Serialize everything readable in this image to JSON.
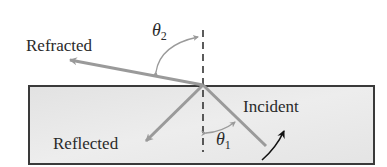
{
  "diagram": {
    "title": "",
    "labels": {
      "refracted": "Refracted",
      "reflected": "Reflected",
      "incident": "Incident"
    },
    "angles": {
      "theta2": {
        "symbol": "θ",
        "subscript": "2"
      },
      "theta1": {
        "symbol": "θ",
        "subscript": "1"
      }
    },
    "colors": {
      "medium_fill": "#e6e6e6",
      "medium_border": "#3a3a3a",
      "ray": "#9a9a9a",
      "normal_line": "#333333",
      "angle_arc": "#9a9a9a",
      "direction_arrow": "#111111",
      "text": "#2a2a2a"
    },
    "geometry": {
      "medium_box": {
        "x": 28,
        "y": 85,
        "width": 346,
        "height": 80
      },
      "interface_point": {
        "x": 203,
        "y": 85
      },
      "incident_ray": {
        "from": [
          266,
          146
        ],
        "to": [
          203,
          85
        ]
      },
      "reflected_ray": {
        "from": [
          203,
          85
        ],
        "to": [
          144,
          143
        ]
      },
      "refracted_ray": {
        "from": [
          203,
          85
        ],
        "to": [
          68,
          60
        ]
      },
      "normal_line": {
        "x": 203,
        "y_top": 30,
        "y_bottom": 150
      }
    }
  }
}
